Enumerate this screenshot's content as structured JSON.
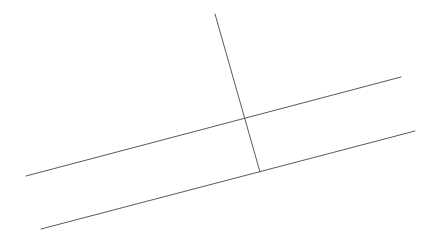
{
  "diagram": {
    "type": "geometry",
    "background": "#ffffff",
    "stroke_color": "#5a5a5a",
    "stroke_width": 1,
    "lines": [
      {
        "id": "parallel-line-upper",
        "x1": 26,
        "y1": 176,
        "x2": 401,
        "y2": 77
      },
      {
        "id": "parallel-line-lower",
        "x1": 41,
        "y1": 229,
        "x2": 415,
        "y2": 131
      },
      {
        "id": "transversal-line",
        "x1": 215,
        "y1": 14,
        "x2": 260,
        "y2": 172
      }
    ]
  }
}
